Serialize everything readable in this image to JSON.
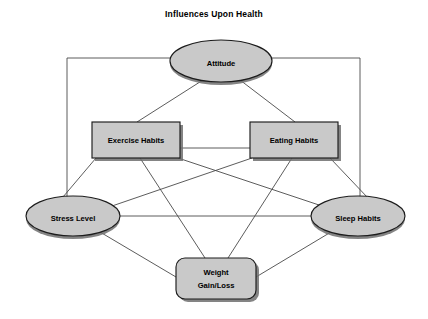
{
  "diagram": {
    "title": "Influences Upon Health",
    "title_pos": {
      "x": 214,
      "y": 17
    },
    "background_color": "#ffffff",
    "node_fill_color": "#c9c9c9",
    "node_stroke_color": "#1c1c1c",
    "node_shadow_color": "#6e6e6e",
    "edge_color": "#4a4a4a",
    "text_color": "#000000",
    "nodes": [
      {
        "id": "attitude",
        "label": "Attitude",
        "shape": "ellipse",
        "cx": 221,
        "cy": 61,
        "rx": 51,
        "ry": 21
      },
      {
        "id": "exercise-habits",
        "label": "Exercise Habits",
        "shape": "rect",
        "x": 92,
        "y": 122,
        "width": 88,
        "height": 36
      },
      {
        "id": "eating-habits",
        "label": "Eating Habits",
        "shape": "rect",
        "x": 250,
        "y": 122,
        "width": 88,
        "height": 36
      },
      {
        "id": "stress-level",
        "label": "Stress Level",
        "shape": "ellipse",
        "cx": 73,
        "cy": 216,
        "rx": 47,
        "ry": 20
      },
      {
        "id": "sleep-habits",
        "label": "Sleep Habits",
        "shape": "ellipse",
        "cx": 358,
        "cy": 216,
        "rx": 47,
        "ry": 20
      },
      {
        "id": "weight-gain-loss",
        "label": "Weight\nGain/Loss",
        "label_line1": "Weight",
        "label_line2": "Gain/Loss",
        "shape": "rounded-rect",
        "x": 176,
        "y": 258,
        "width": 80,
        "height": 41,
        "corner_radius": 9
      }
    ],
    "edges": [
      {
        "from": "attitude",
        "to": "stress-level",
        "routing": "orthogonal-left",
        "points": "170,58 67,58 67,214"
      },
      {
        "from": "attitude",
        "to": "sleep-habits",
        "routing": "orthogonal-right",
        "points": "272,58 360,58 360,214"
      },
      {
        "from": "attitude",
        "to": "exercise-habits",
        "routing": "straight",
        "points": "203,80 137,122"
      },
      {
        "from": "attitude",
        "to": "eating-habits",
        "routing": "straight",
        "points": "240,80 295,122"
      },
      {
        "from": "exercise-habits",
        "to": "eating-habits",
        "routing": "straight",
        "points": "180,148 250,148"
      },
      {
        "from": "exercise-habits",
        "to": "stress-level",
        "routing": "straight",
        "points": "96,158 63,197"
      },
      {
        "from": "exercise-habits",
        "to": "sleep-habits",
        "routing": "straight",
        "points": "178,158 322,206"
      },
      {
        "from": "exercise-habits",
        "to": "weight-gain-loss",
        "routing": "straight",
        "points": "140,158 205,258"
      },
      {
        "from": "eating-habits",
        "to": "sleep-habits",
        "routing": "straight",
        "points": "330,158 368,198"
      },
      {
        "from": "eating-habits",
        "to": "stress-level",
        "routing": "straight",
        "points": "252,158 112,206"
      },
      {
        "from": "eating-habits",
        "to": "weight-gain-loss",
        "routing": "straight",
        "points": "292,158 228,258"
      },
      {
        "from": "stress-level",
        "to": "sleep-habits",
        "routing": "straight",
        "points": "120,216 311,216"
      },
      {
        "from": "stress-level",
        "to": "weight-gain-loss",
        "routing": "straight",
        "points": "100,232 176,277"
      },
      {
        "from": "sleep-habits",
        "to": "weight-gain-loss",
        "routing": "straight",
        "points": "331,232 256,277"
      }
    ]
  }
}
